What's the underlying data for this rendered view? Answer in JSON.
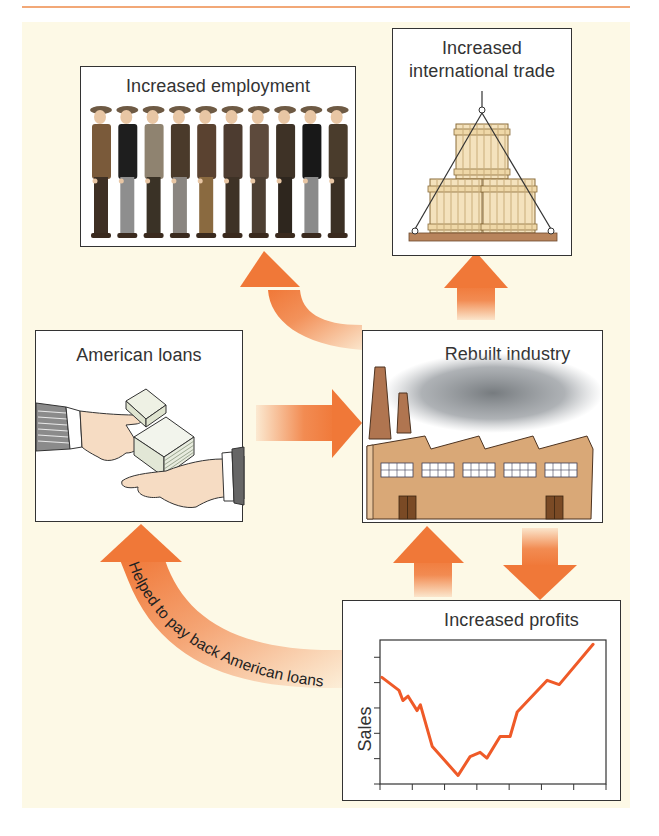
{
  "diagram": {
    "nodes": [
      {
        "id": "employment",
        "label": "Increased employment",
        "illustration": "row of ten workers in flat caps"
      },
      {
        "id": "trade",
        "label_lines": [
          "Increased",
          "international trade"
        ],
        "illustration": "stacked wooden crates on pallet hoisted by rope"
      },
      {
        "id": "loans",
        "label": "American loans",
        "illustration": "hand passing stacks of banknotes to another hand"
      },
      {
        "id": "industry",
        "label": "Rebuilt industry",
        "illustration": "factory with two smokestacks and smoke cloud"
      },
      {
        "id": "profits",
        "label": "Increased profits",
        "illustration": "line chart of sales"
      }
    ],
    "edges": [
      {
        "from": "loans",
        "to": "industry",
        "style": "straight arrow right"
      },
      {
        "from": "industry",
        "to": "employment",
        "style": "curved arrow up-left"
      },
      {
        "from": "industry",
        "to": "trade",
        "style": "straight arrow up"
      },
      {
        "from": "industry",
        "to": "profits",
        "style": "straight arrow down"
      },
      {
        "from": "profits",
        "to": "industry",
        "style": "straight arrow up"
      },
      {
        "from": "profits",
        "to": "loans",
        "style": "curved arrow",
        "label": "Helped to pay back American loans"
      }
    ],
    "arrow_label": "Helped to pay back American loans"
  },
  "colors": {
    "arrow": "#f07838",
    "background": "#fdf9e6",
    "top_rule": "#f2a877",
    "chart_line": "#ef5a28",
    "box_border": "#333333"
  },
  "chart_data": {
    "type": "line",
    "title": "Increased profits",
    "xlabel": "",
    "ylabel": "Sales",
    "x_ticks": 8,
    "y_ticks": 6,
    "xlim": [
      0,
      7
    ],
    "ylim": [
      0,
      100
    ],
    "grid": false,
    "tick_labels": "none",
    "series": [
      {
        "name": "Sales",
        "x": [
          0.06,
          0.59,
          0.71,
          0.87,
          1.15,
          1.25,
          1.62,
          2.42,
          2.79,
          3.1,
          3.31,
          3.72,
          4.03,
          4.25,
          5.18,
          5.55,
          6.6
        ],
        "values": [
          74,
          65,
          58,
          61,
          51,
          55,
          26,
          6,
          19,
          22,
          18,
          33,
          33,
          50,
          72,
          69,
          97
        ]
      }
    ]
  }
}
